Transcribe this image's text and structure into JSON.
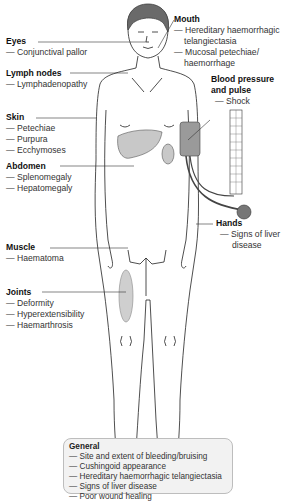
{
  "labels": {
    "eyes": {
      "heading": "Eyes",
      "items": [
        "— Conjunctival pallor"
      ]
    },
    "lymph": {
      "heading": "Lymph nodes",
      "items": [
        "— Lymphadenopathy"
      ]
    },
    "skin": {
      "heading": "Skin",
      "items": [
        "— Petechiae",
        "— Purpura",
        "— Ecchymoses"
      ]
    },
    "abdomen": {
      "heading": "Abdomen",
      "items": [
        "— Splenomegaly",
        "— Hepatomegaly"
      ]
    },
    "muscle": {
      "heading": "Muscle",
      "items": [
        "— Haematoma"
      ]
    },
    "joints": {
      "heading": "Joints",
      "items": [
        "— Deformity",
        "— Hyperextensibility",
        "— Haemarthrosis"
      ]
    },
    "mouth": {
      "heading": "Mouth",
      "items": [
        "— Hereditary haemorrhagic",
        "telangiectasia",
        "— Mucosal petechiae/",
        "haemorrhage"
      ]
    },
    "bp": {
      "heading1": "Blood pressure",
      "heading2": "and pulse",
      "items": [
        "— Shock"
      ]
    },
    "hands": {
      "heading": "Hands",
      "items": [
        "— Signs of liver",
        "disease"
      ]
    }
  },
  "general": {
    "heading": "General",
    "items": [
      "— Site and extent of bleeding/bruising",
      "— Cushingoid appearance",
      "— Hereditary haemorrhagic telangiectasia",
      "— Signs of liver disease",
      "— Poor wound healing"
    ]
  },
  "colors": {
    "organ_fill": "#c8c8c8",
    "cuff_fill": "#9a9a9a",
    "box_fill": "#f2f2f2"
  }
}
